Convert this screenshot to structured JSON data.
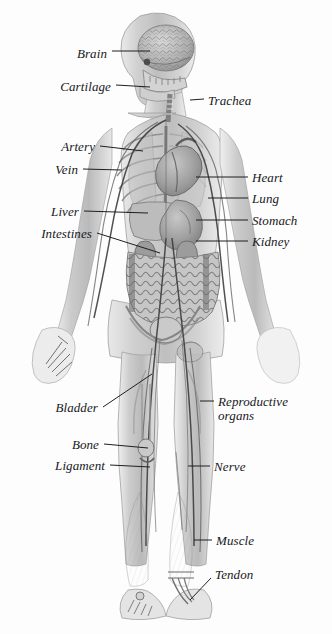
{
  "figure": {
    "background_color": "#fdfdfd",
    "ink_color": "#16181c",
    "view": "anterior full-body"
  },
  "labels": [
    {
      "id": "brain",
      "text": "Brain",
      "side": "left",
      "x": 68,
      "y": 47,
      "lx1": 112,
      "ly1": 51,
      "lx2": 150,
      "ly2": 51
    },
    {
      "id": "cartilage",
      "text": "Cartilage",
      "side": "left",
      "x": 55,
      "y": 80,
      "lx1": 116,
      "ly1": 85,
      "lx2": 150,
      "ly2": 87
    },
    {
      "id": "trachea",
      "text": "Trachea",
      "side": "right",
      "x": 208,
      "y": 94,
      "lx1": 190,
      "ly1": 100,
      "lx2": 204,
      "ly2": 99
    },
    {
      "id": "artery",
      "text": "Artery",
      "side": "left",
      "x": 57,
      "y": 140,
      "lx1": 100,
      "ly1": 146,
      "lx2": 143,
      "ly2": 151
    },
    {
      "id": "vein",
      "text": "Vein",
      "side": "left",
      "x": 50,
      "y": 163,
      "lx1": 83,
      "ly1": 169,
      "lx2": 122,
      "ly2": 170
    },
    {
      "id": "heart",
      "text": "Heart",
      "side": "right",
      "x": 252,
      "y": 171,
      "lx1": 196,
      "ly1": 177,
      "lx2": 248,
      "ly2": 177
    },
    {
      "id": "lung",
      "text": "Lung",
      "side": "right",
      "x": 252,
      "y": 192,
      "lx1": 208,
      "ly1": 198,
      "lx2": 248,
      "ly2": 198
    },
    {
      "id": "liver",
      "text": "Liver",
      "side": "left",
      "x": 48,
      "y": 205,
      "lx1": 84,
      "ly1": 211,
      "lx2": 148,
      "ly2": 213
    },
    {
      "id": "stomach",
      "text": "Stomach",
      "side": "right",
      "x": 252,
      "y": 214,
      "lx1": 196,
      "ly1": 220,
      "lx2": 248,
      "ly2": 220
    },
    {
      "id": "intestines",
      "text": "Intestines",
      "side": "left",
      "x": 25,
      "y": 227,
      "lx1": 97,
      "ly1": 233,
      "lx2": 160,
      "ly2": 253
    },
    {
      "id": "kidney",
      "text": "Kidney",
      "side": "right",
      "x": 252,
      "y": 235,
      "lx1": 196,
      "ly1": 241,
      "lx2": 248,
      "ly2": 241
    },
    {
      "id": "bladder",
      "text": "Bladder",
      "side": "left",
      "x": 42,
      "y": 401,
      "lx1": 103,
      "ly1": 407,
      "lx2": 152,
      "ly2": 374
    },
    {
      "id": "reproductive",
      "text": "Reproductive organs",
      "side": "right",
      "x": 218,
      "y": 395,
      "lx1": 200,
      "ly1": 401,
      "lx2": 214,
      "ly2": 401
    },
    {
      "id": "bone",
      "text": "Bone",
      "side": "left",
      "x": 68,
      "y": 438,
      "lx1": 104,
      "ly1": 444,
      "lx2": 148,
      "ly2": 448
    },
    {
      "id": "ligament",
      "text": "Ligament",
      "side": "left",
      "x": 42,
      "y": 459,
      "lx1": 110,
      "ly1": 465,
      "lx2": 150,
      "ly2": 467
    },
    {
      "id": "nerve",
      "text": "Nerve",
      "side": "right",
      "x": 214,
      "y": 460,
      "lx1": 188,
      "ly1": 466,
      "lx2": 210,
      "ly2": 466
    },
    {
      "id": "muscle",
      "text": "Muscle",
      "side": "right",
      "x": 216,
      "y": 534,
      "lx1": 194,
      "ly1": 540,
      "lx2": 212,
      "ly2": 540
    },
    {
      "id": "tendon",
      "text": "Tendon",
      "side": "right",
      "x": 214,
      "y": 568,
      "lx1": 190,
      "ly1": 600,
      "lx2": 211,
      "ly2": 578
    }
  ],
  "structures": [
    {
      "name": "brain",
      "region": "head"
    },
    {
      "name": "skull",
      "region": "head"
    },
    {
      "name": "jaw-teeth",
      "region": "head"
    },
    {
      "name": "cartilage-larynx",
      "region": "neck"
    },
    {
      "name": "trachea",
      "region": "neck"
    },
    {
      "name": "rib-cage",
      "region": "thorax"
    },
    {
      "name": "heart",
      "region": "thorax"
    },
    {
      "name": "lungs",
      "region": "thorax"
    },
    {
      "name": "liver",
      "region": "abdomen"
    },
    {
      "name": "stomach",
      "region": "abdomen"
    },
    {
      "name": "kidneys",
      "region": "abdomen"
    },
    {
      "name": "intestines",
      "region": "abdomen"
    },
    {
      "name": "bladder",
      "region": "pelvis"
    },
    {
      "name": "pelvis-bone",
      "region": "pelvis"
    },
    {
      "name": "arteries",
      "region": "whole-body"
    },
    {
      "name": "veins",
      "region": "whole-body"
    },
    {
      "name": "nerves",
      "region": "whole-body"
    },
    {
      "name": "muscles",
      "region": "limbs"
    },
    {
      "name": "tendons",
      "region": "ankle"
    },
    {
      "name": "hand-bones",
      "region": "left-hand"
    },
    {
      "name": "foot-bones",
      "region": "left-foot"
    }
  ]
}
